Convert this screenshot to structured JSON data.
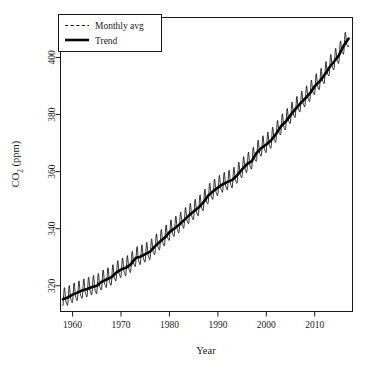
{
  "chart_data": {
    "type": "line",
    "title": "",
    "xlabel": "Year",
    "ylabel": "CO2 (ppm)",
    "ylabel_parts": {
      "prefix": "CO",
      "sub": "2",
      "suffix": " (ppm)"
    },
    "xlim": [
      1957.5,
      2017.8
    ],
    "ylim": [
      311.0,
      414.0
    ],
    "xticks": [
      1960,
      1970,
      1980,
      1990,
      2000,
      2010
    ],
    "xticklabels": [
      "1960",
      "1970",
      "1980",
      "1990",
      "2000",
      "2010"
    ],
    "yticks": [
      320,
      340,
      360,
      380,
      400
    ],
    "yticklabels": [
      "320",
      "340",
      "360",
      "380",
      "400"
    ],
    "grid": false,
    "legend_position": "top-left",
    "seasonal_amplitude_ppm": 3.1,
    "seasonal_peak_month": 5,
    "seasonal_trough_month": 9,
    "series": [
      {
        "name": "Monthly avg",
        "style": "dashed-thin",
        "color": "#111111",
        "description": "Monthly mean CO2 with seasonal sawtooth oscillation superimposed on the trend"
      },
      {
        "name": "Trend",
        "style": "solid-thick",
        "color": "#000000",
        "x": [
          1958,
          1959,
          1960,
          1961,
          1962,
          1963,
          1964,
          1965,
          1966,
          1967,
          1968,
          1969,
          1970,
          1971,
          1972,
          1973,
          1974,
          1975,
          1976,
          1977,
          1978,
          1979,
          1980,
          1981,
          1982,
          1983,
          1984,
          1985,
          1986,
          1987,
          1988,
          1989,
          1990,
          1991,
          1992,
          1993,
          1994,
          1995,
          1996,
          1997,
          1998,
          1999,
          2000,
          2001,
          2002,
          2003,
          2004,
          2005,
          2006,
          2007,
          2008,
          2009,
          2010,
          2011,
          2012,
          2013,
          2014,
          2015,
          2016,
          2017
        ],
        "values": [
          315.3,
          315.9,
          316.9,
          317.6,
          318.4,
          318.9,
          319.6,
          320.0,
          321.4,
          322.2,
          323.0,
          324.6,
          325.7,
          326.3,
          327.5,
          329.7,
          330.2,
          331.1,
          332.0,
          333.8,
          335.4,
          336.8,
          338.8,
          340.1,
          341.4,
          343.0,
          344.6,
          346.0,
          347.4,
          349.2,
          351.6,
          353.1,
          354.4,
          355.6,
          356.4,
          357.1,
          358.8,
          360.8,
          362.6,
          363.7,
          366.6,
          368.3,
          369.5,
          371.0,
          373.2,
          375.8,
          377.5,
          379.8,
          381.9,
          383.8,
          385.6,
          387.4,
          389.9,
          391.6,
          393.8,
          396.5,
          398.6,
          400.8,
          404.2,
          406.6
        ]
      }
    ]
  },
  "legend": {
    "items": [
      {
        "label": "Monthly avg",
        "style": "dashed"
      },
      {
        "label": "Trend",
        "style": "solid"
      }
    ]
  },
  "colors": {
    "foreground": "#1a1a1a",
    "series_monthly": "#111111",
    "series_trend": "#000000",
    "background": "#ffffff"
  }
}
